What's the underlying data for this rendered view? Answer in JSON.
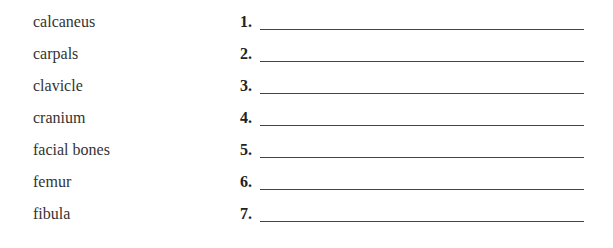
{
  "worksheet": {
    "rows": [
      {
        "term": "calcaneus",
        "number": "1."
      },
      {
        "term": "carpals",
        "number": "2."
      },
      {
        "term": "clavicle",
        "number": "3."
      },
      {
        "term": "cranium",
        "number": "4."
      },
      {
        "term": "facial bones",
        "number": "5."
      },
      {
        "term": "femur",
        "number": "6."
      },
      {
        "term": "fibula",
        "number": "7."
      }
    ]
  }
}
